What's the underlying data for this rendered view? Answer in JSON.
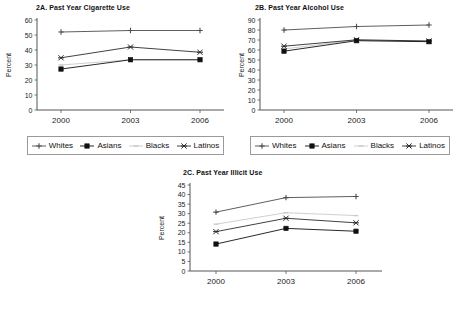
{
  "figure": {
    "series_names": [
      "Whites",
      "Asians",
      "Blacks",
      "Latinos"
    ],
    "series_colors": [
      "#4d4d4d",
      "#111111",
      "#c9c9c9",
      "#2b2b2b"
    ],
    "markers": [
      "plus",
      "square",
      "dash",
      "star"
    ]
  },
  "legend": {
    "items": [
      {
        "label": "Whites",
        "marker": "plus-marker",
        "color": "#4d4d4d"
      },
      {
        "label": "Asians",
        "marker": "square-marker",
        "color": "#111111"
      },
      {
        "label": "Blacks",
        "marker": "dash-marker",
        "color": "#c9c9c9"
      },
      {
        "label": "Latinos",
        "marker": "star-marker",
        "color": "#2b2b2b"
      }
    ]
  },
  "chart_data": [
    {
      "id": "chart-2a",
      "type": "line",
      "title": "2A. Past Year Cigarette Use",
      "xlabel": "",
      "ylabel": "Percent",
      "categories": [
        "2000",
        "2003",
        "2006"
      ],
      "ylim": [
        0,
        60
      ],
      "yticks": [
        0,
        10,
        20,
        30,
        40,
        50,
        60
      ],
      "grid": false,
      "legend_position": "bottom",
      "series": [
        {
          "name": "Whites",
          "values": [
            52.0,
            53.0,
            53.0
          ]
        },
        {
          "name": "Asians",
          "values": [
            27.3,
            33.5,
            33.5
          ]
        },
        {
          "name": "Blacks",
          "values": [
            30.0,
            33.5,
            33.5
          ]
        },
        {
          "name": "Latinos",
          "values": [
            34.8,
            42.0,
            38.5
          ]
        }
      ]
    },
    {
      "id": "chart-2b",
      "type": "line",
      "title": "2B. Past Year Alcohol Use",
      "xlabel": "",
      "ylabel": "Percent",
      "categories": [
        "2000",
        "2003",
        "2006"
      ],
      "ylim": [
        0,
        90
      ],
      "yticks": [
        0,
        10,
        20,
        30,
        40,
        50,
        60,
        70,
        80,
        90
      ],
      "grid": false,
      "legend_position": "bottom",
      "series": [
        {
          "name": "Whites",
          "values": [
            80.0,
            83.5,
            85.0
          ]
        },
        {
          "name": "Asians",
          "values": [
            58.8,
            69.3,
            68.3
          ]
        },
        {
          "name": "Blacks",
          "values": [
            61.0,
            70.0,
            69.0
          ]
        },
        {
          "name": "Latinos",
          "values": [
            63.8,
            70.2,
            69.0
          ]
        }
      ]
    },
    {
      "id": "chart-2c",
      "type": "line",
      "title": "2C. Past Year Illicit Use",
      "xlabel": "",
      "ylabel": "Percent",
      "categories": [
        "2000",
        "2003",
        "2006"
      ],
      "ylim": [
        0,
        45
      ],
      "yticks": [
        0,
        5,
        10,
        15,
        20,
        25,
        30,
        35,
        40,
        45
      ],
      "grid": false,
      "legend_position": "bottom",
      "series": [
        {
          "name": "Whites",
          "values": [
            30.8,
            38.4,
            39.0
          ]
        },
        {
          "name": "Asians",
          "values": [
            14.1,
            22.3,
            20.8
          ]
        },
        {
          "name": "Blacks",
          "values": [
            24.5,
            30.5,
            29.0
          ]
        },
        {
          "name": "Latinos",
          "values": [
            20.6,
            27.6,
            25.2
          ]
        }
      ]
    }
  ]
}
